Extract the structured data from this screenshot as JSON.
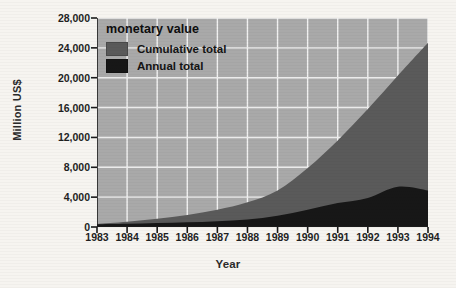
{
  "chart_data": {
    "type": "area",
    "title": "",
    "xlabel": "Year",
    "ylabel": "Million US$",
    "x": [
      1983,
      1984,
      1985,
      1986,
      1987,
      1988,
      1989,
      1990,
      1991,
      1992,
      1993,
      1994
    ],
    "xtick_labels": [
      "1983",
      "1984",
      "1985",
      "1986",
      "1987",
      "1988",
      "1989",
      "1990",
      "1991",
      "1992",
      "1993",
      "1994"
    ],
    "ytick_labels": [
      "0",
      "4,000",
      "8,000",
      "12,000",
      "16,000",
      "20,000",
      "24,000",
      "28,000"
    ],
    "ytick_values": [
      0,
      4000,
      8000,
      12000,
      16000,
      20000,
      24000,
      28000
    ],
    "ylim": [
      0,
      28000
    ],
    "xlim": [
      1983,
      1994
    ],
    "grid": true,
    "legend_position": "top-left",
    "legend_title": "monetary value",
    "series": [
      {
        "name": "Cumulative total",
        "color": "#5a5a5a",
        "values": [
          400,
          700,
          1100,
          1600,
          2300,
          3300,
          4900,
          7900,
          11600,
          15800,
          20300,
          24700
        ]
      },
      {
        "name": "Annual total",
        "color": "#171717",
        "values": [
          350,
          420,
          520,
          620,
          780,
          1000,
          1500,
          2300,
          3200,
          3900,
          5400,
          4900
        ]
      }
    ],
    "colors": {
      "plot_background": "#a9a9a9",
      "gridline": "#f1f1f1",
      "cumulative": "#5a5a5a",
      "annual": "#171717",
      "axis": "#1b1b1b",
      "page_background": "#f6f4f0",
      "text": "#1f1f1f"
    }
  },
  "legend": {
    "title": "monetary value",
    "items": [
      {
        "label": "Cumulative total",
        "color": "#5a5a5a"
      },
      {
        "label": "Annual total",
        "color": "#171717"
      }
    ]
  },
  "axes": {
    "y_title": "Million US$",
    "x_title": "Year"
  }
}
